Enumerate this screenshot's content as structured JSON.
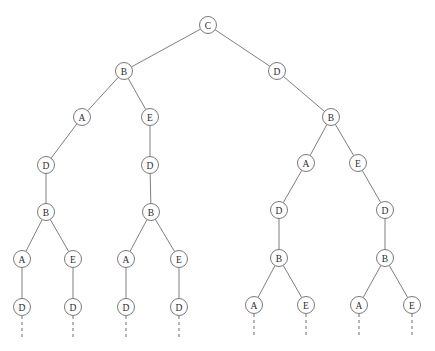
{
  "diagram": {
    "type": "tree",
    "title": "",
    "node_radius": 8.5,
    "colors": {
      "background": "#ffffff",
      "node_fill": "#ffffff",
      "node_stroke": "#6a6a6a",
      "edge_stroke": "#6f6f6f",
      "stub_stroke": "#7a7a7a",
      "label_color": "#2b2b2b"
    },
    "nodes": [
      {
        "id": "n0",
        "label": "C",
        "x": 208,
        "y": 25,
        "depth": 0
      },
      {
        "id": "n1",
        "label": "B",
        "x": 124,
        "y": 71,
        "depth": 1
      },
      {
        "id": "n2",
        "label": "D",
        "x": 277,
        "y": 71,
        "depth": 1
      },
      {
        "id": "n3",
        "label": "A",
        "x": 82,
        "y": 117,
        "depth": 2
      },
      {
        "id": "n4",
        "label": "E",
        "x": 150,
        "y": 117,
        "depth": 2
      },
      {
        "id": "n5",
        "label": "B",
        "x": 331,
        "y": 117,
        "depth": 2
      },
      {
        "id": "n6",
        "label": "D",
        "x": 46,
        "y": 165,
        "depth": 3
      },
      {
        "id": "n7",
        "label": "D",
        "x": 150,
        "y": 165,
        "depth": 3
      },
      {
        "id": "n8",
        "label": "A",
        "x": 306,
        "y": 163,
        "depth": 3
      },
      {
        "id": "n9",
        "label": "E",
        "x": 358,
        "y": 163,
        "depth": 3
      },
      {
        "id": "n10",
        "label": "B",
        "x": 46,
        "y": 212,
        "depth": 4
      },
      {
        "id": "n11",
        "label": "B",
        "x": 151,
        "y": 212,
        "depth": 4
      },
      {
        "id": "n12",
        "label": "D",
        "x": 279,
        "y": 210,
        "depth": 4
      },
      {
        "id": "n13",
        "label": "D",
        "x": 385,
        "y": 210,
        "depth": 4
      },
      {
        "id": "n14",
        "label": "A",
        "x": 22,
        "y": 259,
        "depth": 5
      },
      {
        "id": "n15",
        "label": "E",
        "x": 73,
        "y": 259,
        "depth": 5
      },
      {
        "id": "n16",
        "label": "A",
        "x": 126,
        "y": 259,
        "depth": 5
      },
      {
        "id": "n17",
        "label": "E",
        "x": 179,
        "y": 259,
        "depth": 5
      },
      {
        "id": "n18",
        "label": "B",
        "x": 279,
        "y": 258,
        "depth": 5
      },
      {
        "id": "n19",
        "label": "B",
        "x": 385,
        "y": 258,
        "depth": 5
      },
      {
        "id": "n20",
        "label": "D",
        "x": 22,
        "y": 307,
        "depth": 6
      },
      {
        "id": "n21",
        "label": "D",
        "x": 73,
        "y": 307,
        "depth": 6
      },
      {
        "id": "n22",
        "label": "D",
        "x": 126,
        "y": 307,
        "depth": 6
      },
      {
        "id": "n23",
        "label": "D",
        "x": 179,
        "y": 307,
        "depth": 6
      },
      {
        "id": "n24",
        "label": "A",
        "x": 254,
        "y": 305,
        "depth": 6
      },
      {
        "id": "n25",
        "label": "E",
        "x": 306,
        "y": 305,
        "depth": 6
      },
      {
        "id": "n26",
        "label": "A",
        "x": 359,
        "y": 305,
        "depth": 6
      },
      {
        "id": "n27",
        "label": "E",
        "x": 412,
        "y": 305,
        "depth": 6
      }
    ],
    "edges": [
      {
        "from": "n0",
        "to": "n1"
      },
      {
        "from": "n0",
        "to": "n2"
      },
      {
        "from": "n1",
        "to": "n3"
      },
      {
        "from": "n1",
        "to": "n4"
      },
      {
        "from": "n2",
        "to": "n5"
      },
      {
        "from": "n3",
        "to": "n6"
      },
      {
        "from": "n4",
        "to": "n7"
      },
      {
        "from": "n5",
        "to": "n8"
      },
      {
        "from": "n5",
        "to": "n9"
      },
      {
        "from": "n6",
        "to": "n10"
      },
      {
        "from": "n7",
        "to": "n11"
      },
      {
        "from": "n8",
        "to": "n12"
      },
      {
        "from": "n9",
        "to": "n13"
      },
      {
        "from": "n10",
        "to": "n14"
      },
      {
        "from": "n10",
        "to": "n15"
      },
      {
        "from": "n11",
        "to": "n16"
      },
      {
        "from": "n11",
        "to": "n17"
      },
      {
        "from": "n12",
        "to": "n18"
      },
      {
        "from": "n13",
        "to": "n19"
      },
      {
        "from": "n14",
        "to": "n20"
      },
      {
        "from": "n15",
        "to": "n21"
      },
      {
        "from": "n16",
        "to": "n22"
      },
      {
        "from": "n17",
        "to": "n23"
      },
      {
        "from": "n18",
        "to": "n24"
      },
      {
        "from": "n18",
        "to": "n25"
      },
      {
        "from": "n19",
        "to": "n26"
      },
      {
        "from": "n19",
        "to": "n27"
      }
    ],
    "continuation_stubs": [
      {
        "from": "n20",
        "x": 22,
        "y_start": 316,
        "y_end": 340
      },
      {
        "from": "n21",
        "x": 73,
        "y_start": 316,
        "y_end": 340
      },
      {
        "from": "n22",
        "x": 126,
        "y_start": 316,
        "y_end": 340
      },
      {
        "from": "n23",
        "x": 179,
        "y_start": 316,
        "y_end": 340
      },
      {
        "from": "n24",
        "x": 254,
        "y_start": 314,
        "y_end": 336
      },
      {
        "from": "n25",
        "x": 306,
        "y_start": 314,
        "y_end": 336
      },
      {
        "from": "n26",
        "x": 359,
        "y_start": 314,
        "y_end": 336
      },
      {
        "from": "n27",
        "x": 412,
        "y_start": 314,
        "y_end": 336
      }
    ]
  }
}
